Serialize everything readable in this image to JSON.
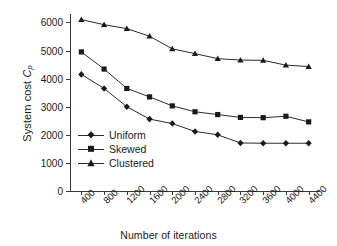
{
  "chart_data": {
    "type": "line",
    "title": "",
    "xlabel": "Number of iterations",
    "ylabel": "System cost C_p",
    "ylabel_main": "System cost ",
    "ylabel_symbol": "C",
    "ylabel_subscript": "p",
    "x": [
      400,
      800,
      1200,
      1600,
      2000,
      2400,
      2800,
      3200,
      3600,
      4000,
      4400
    ],
    "categories": [
      "400",
      "800",
      "1200",
      "1600",
      "2000",
      "2400",
      "2800",
      "3200",
      "3600",
      "4000",
      "4400"
    ],
    "xtick_labels": [
      "400",
      "800",
      "1200",
      "1600",
      "2000",
      "2400",
      "2800",
      "3200",
      "3600",
      "4000",
      "4400"
    ],
    "ytick_labels": [
      "0",
      "1000",
      "2000",
      "3000",
      "4000",
      "5000",
      "6000"
    ],
    "yticks": [
      0,
      1000,
      2000,
      3000,
      4000,
      5000,
      6000
    ],
    "ylim": [
      0,
      6300
    ],
    "xlim": [
      200,
      4600
    ],
    "grid": false,
    "legend_position": "inside-lower-left",
    "series": [
      {
        "name": "Uniform",
        "marker": "diamond",
        "color": "#1a1a1a",
        "values": [
          4150,
          3650,
          3000,
          2560,
          2400,
          2120,
          2000,
          1710,
          1700,
          1700,
          1700
        ]
      },
      {
        "name": "Skewed",
        "marker": "square",
        "color": "#1a1a1a",
        "values": [
          4950,
          4340,
          3650,
          3350,
          3030,
          2820,
          2720,
          2620,
          2610,
          2660,
          2460
        ]
      },
      {
        "name": "Clustered",
        "marker": "triangle",
        "color": "#1a1a1a",
        "values": [
          6100,
          5920,
          5780,
          5510,
          5060,
          4890,
          4710,
          4660,
          4650,
          4480,
          4430
        ]
      }
    ]
  },
  "legend": {
    "items": [
      {
        "label": "Uniform"
      },
      {
        "label": "Skewed"
      },
      {
        "label": "Clustered"
      }
    ]
  }
}
